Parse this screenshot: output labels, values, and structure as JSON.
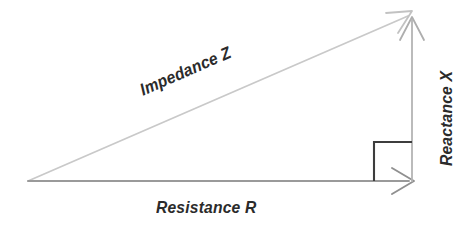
{
  "diagram": {
    "type": "right-triangle-vector-diagram",
    "background_color": "#ffffff",
    "labels": {
      "hypotenuse": "Impedance Z",
      "base": "Resistance R",
      "vertical": "Reactance X"
    },
    "colors": {
      "hypotenuse_line": "#c9c9c9",
      "base_line": "#9a9a9a",
      "vertical_line": "#b4b4b4",
      "right_angle_marker": "#3d3d3d",
      "text": "#2b2b2b"
    },
    "geometry": {
      "origin": [
        28,
        181
      ],
      "corner_right": [
        412,
        181
      ],
      "apex": [
        412,
        14
      ],
      "right_angle_marker": [
        374,
        142,
        38,
        39
      ]
    },
    "arrows": [
      {
        "name": "impedance-arrow",
        "from": [
          28,
          181
        ],
        "to": [
          412,
          14
        ]
      },
      {
        "name": "resistance-arrow",
        "from": [
          28,
          181
        ],
        "to": [
          413,
          181
        ]
      },
      {
        "name": "reactance-arrow",
        "from": [
          412,
          181
        ],
        "to": [
          412,
          16
        ]
      }
    ]
  }
}
